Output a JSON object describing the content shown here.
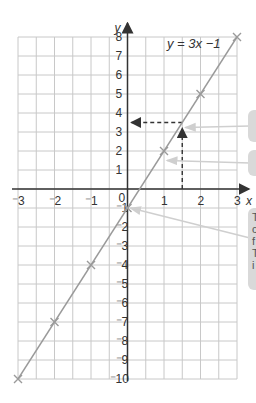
{
  "chart_data": {
    "type": "line",
    "title": "y = 3x −1",
    "xlabel": "x",
    "ylabel": "y",
    "xlim": [
      -3,
      3
    ],
    "ylim": [
      -10,
      8
    ],
    "grid": true,
    "x_ticks": [
      -3,
      -2,
      -1,
      0,
      1,
      2,
      3
    ],
    "y_ticks": [
      8,
      7,
      6,
      5,
      4,
      3,
      2,
      1,
      -1,
      -2,
      -3,
      -4,
      -5,
      -6,
      -7,
      -8,
      -9,
      -10
    ],
    "series": [
      {
        "name": "y = 3x −1",
        "x": [
          -3,
          -2,
          -1,
          0,
          1,
          2,
          3
        ],
        "y": [
          -10,
          -7,
          -4,
          -1,
          2,
          5,
          8
        ],
        "marker": "x",
        "color": "#9a9a9a"
      }
    ],
    "annotations": [
      {
        "type": "dashed-arrow",
        "from": [
          1.5,
          0
        ],
        "to": [
          1.5,
          3.5
        ],
        "label": "read up from x = 1.5"
      },
      {
        "type": "dashed-arrow",
        "from": [
          1.5,
          3.5
        ],
        "to": [
          0,
          3.5
        ],
        "label": "read across to y = 3.5"
      },
      {
        "type": "pointer",
        "target": [
          1.5,
          3.5
        ]
      },
      {
        "type": "pointer",
        "target": [
          1,
          1.5
        ]
      },
      {
        "type": "pointer",
        "target": [
          0,
          -1
        ]
      }
    ]
  },
  "equation_label": "y = 3x −1",
  "axis": {
    "x_label": "x",
    "y_label": "y",
    "origin_label": "0"
  },
  "notes": [
    {
      "text": ""
    },
    {
      "text": ""
    },
    {
      "text": "T\nc\nf\nT\ni"
    }
  ],
  "colors": {
    "grid": "#c8c8c8",
    "axis": "#333333",
    "line": "#9a9a9a",
    "dash": "#333333",
    "pointer": "#cfcfcf",
    "note_bg": "#d9d9d9"
  }
}
